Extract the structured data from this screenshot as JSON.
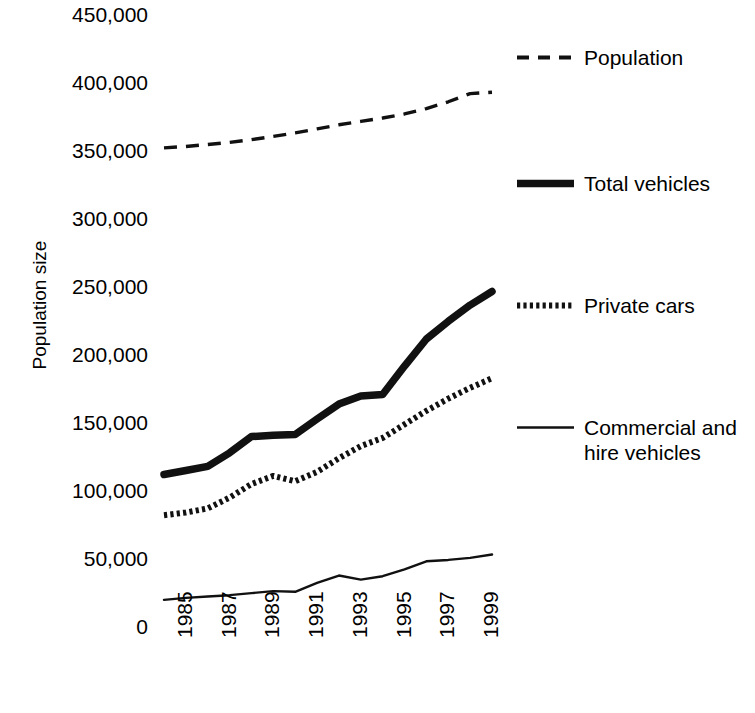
{
  "chart_data": {
    "type": "line",
    "title": "",
    "xlabel": "",
    "ylabel": "Population size",
    "ylim": [
      0,
      450000
    ],
    "xlim": [
      1985,
      2000
    ],
    "grid": false,
    "legend_position": "right",
    "ytick_labels": [
      "450,000",
      "400,000",
      "350,000",
      "300,000",
      "250,000",
      "200,000",
      "150,000",
      "100,000",
      "50,000",
      "0"
    ],
    "ytick_values": [
      450000,
      400000,
      350000,
      300000,
      250000,
      200000,
      150000,
      100000,
      50000,
      0
    ],
    "xtick_labels": [
      "1985",
      "1987",
      "1989",
      "1991",
      "1993",
      "1995",
      "1997",
      "1999"
    ],
    "xtick_values": [
      1985,
      1987,
      1989,
      1991,
      1993,
      1995,
      1997,
      1999
    ],
    "x": [
      1985,
      1986,
      1987,
      1988,
      1989,
      1990,
      1991,
      1992,
      1993,
      1994,
      1995,
      1996,
      1997,
      1998,
      1999,
      2000
    ],
    "series": [
      {
        "name": "Population",
        "style": "dashed",
        "color": "#000000",
        "width": 3,
        "values": [
          352000,
          353000,
          354500,
          356000,
          358000,
          360500,
          363000,
          366000,
          369000,
          371500,
          374000,
          377000,
          381000,
          386000,
          392000,
          393000
        ]
      },
      {
        "name": "Total vehicles",
        "style": "solid-thick",
        "color": "#000000",
        "width": 7,
        "values": [
          111000,
          114000,
          117000,
          127000,
          139000,
          140000,
          140500,
          152000,
          163000,
          169000,
          170000,
          191000,
          211000,
          224000,
          236000,
          246000
        ]
      },
      {
        "name": "Private cars",
        "style": "dotted",
        "color": "#000000",
        "width": 6,
        "values": [
          81000,
          83000,
          86000,
          94000,
          104000,
          110000,
          106000,
          113000,
          123000,
          132000,
          138000,
          148000,
          158000,
          167000,
          175000,
          182000
        ]
      },
      {
        "name": "Commercial and\nhire vehicles",
        "style": "solid-thin",
        "color": "#000000",
        "width": 2,
        "values": [
          18500,
          20000,
          21000,
          22000,
          23500,
          25000,
          24500,
          31000,
          36500,
          33500,
          36000,
          41000,
          47000,
          48000,
          49500,
          52000
        ]
      }
    ]
  },
  "legend": {
    "entries": [
      {
        "label": "Population",
        "swatch": "dashed-line-swatch"
      },
      {
        "label": "Total vehicles",
        "swatch": "thick-line-swatch"
      },
      {
        "label": "Private cars",
        "swatch": "dotted-line-swatch"
      },
      {
        "label": "Commercial and\nhire vehicles",
        "swatch": "thin-line-swatch"
      }
    ]
  },
  "axis": {
    "y_title": "Population size"
  }
}
